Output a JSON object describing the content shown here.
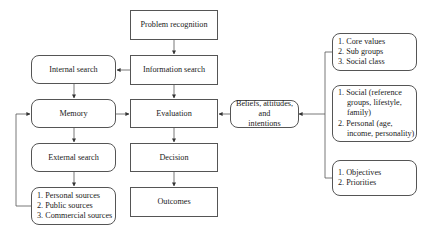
{
  "diagram": {
    "center_column": [
      {
        "id": "problem",
        "label": "Problem recognition"
      },
      {
        "id": "info",
        "label": "Information search"
      },
      {
        "id": "evaluation",
        "label": "Evaluation"
      },
      {
        "id": "decision",
        "label": "Decision"
      },
      {
        "id": "outcomes",
        "label": "Outcomes"
      }
    ],
    "left_column": [
      {
        "id": "internal",
        "label": "Internal search"
      },
      {
        "id": "memory",
        "label": "Memory"
      },
      {
        "id": "external",
        "label": "External search"
      }
    ],
    "sources": {
      "items": [
        "1. Personal sources",
        "2. Public sources",
        "3. Commercial sources"
      ]
    },
    "beliefs": {
      "label_line1": "Beliefs, attitudes, and",
      "label_line2": "intentions"
    },
    "right_boxes": {
      "culture": {
        "items": [
          "1. Core values",
          "2. Sub groups",
          "3. Social class"
        ]
      },
      "influences": {
        "item1_line1": "1. Social (reference",
        "item1_line2": "groups, lifestyle,",
        "item1_line3": "family)",
        "item2_line1": "2. Personal (age,",
        "item2_line2": "income, personality)"
      },
      "goals": {
        "items": [
          "1. Objectives",
          "2. Priorities"
        ]
      }
    },
    "colors": {
      "line": "#555555",
      "text": "#222222",
      "background": "#ffffff"
    }
  }
}
